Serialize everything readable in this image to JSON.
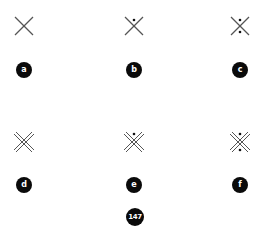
{
  "figure": {
    "items": [
      {
        "label": "a",
        "glyph": "single-saltire",
        "dots": "none"
      },
      {
        "label": "b",
        "glyph": "single-saltire",
        "dots": "top"
      },
      {
        "label": "c",
        "glyph": "single-saltire",
        "dots": "top-bottom"
      },
      {
        "label": "d",
        "glyph": "double-saltire",
        "dots": "none"
      },
      {
        "label": "e",
        "glyph": "double-saltire",
        "dots": "top"
      },
      {
        "label": "f",
        "glyph": "double-saltire",
        "dots": "top-bottom"
      }
    ],
    "page_number": "147",
    "colors": {
      "stroke": "#555555",
      "dot": "#111111",
      "badge": "#0a0a0a",
      "badge_text": "#ffffff"
    }
  }
}
